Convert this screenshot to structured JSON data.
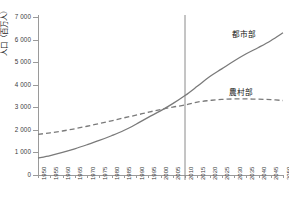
{
  "chart_data": {
    "type": "line",
    "title": "",
    "xlabel": "",
    "ylabel": "人口（百万人）",
    "ylim": [
      0,
      7000
    ],
    "xlim": [
      1950,
      2050
    ],
    "grid": false,
    "legend_position": "inline-right",
    "y_ticks": [
      "0",
      "1 000",
      "2 000",
      "3 000",
      "4 000",
      "5 000",
      "6 000",
      "7 000"
    ],
    "y_tick_values": [
      0,
      1000,
      2000,
      3000,
      4000,
      5000,
      6000,
      7000
    ],
    "categories": [
      "1950",
      "1955",
      "1960",
      "1965",
      "1970",
      "1975",
      "1980",
      "1985",
      "1990",
      "1995",
      "2000",
      "2005",
      "2010",
      "2015",
      "2020",
      "2025",
      "2030",
      "2035",
      "2040",
      "2045",
      "2050"
    ],
    "annotations": [
      {
        "name": "reference-line-2010",
        "x": 2010,
        "label": ""
      }
    ],
    "series": [
      {
        "name": "都市部",
        "style": "solid",
        "color": "#7a7a7a",
        "values": [
          750,
          860,
          1000,
          1160,
          1340,
          1530,
          1740,
          1970,
          2250,
          2550,
          2840,
          3160,
          3520,
          3930,
          4350,
          4700,
          5050,
          5370,
          5650,
          5950,
          6300
        ]
      },
      {
        "name": "農村部",
        "style": "dashed",
        "color": "#7a7a7a",
        "values": [
          1800,
          1870,
          1950,
          2050,
          2160,
          2280,
          2400,
          2530,
          2650,
          2780,
          2900,
          3010,
          3100,
          3230,
          3300,
          3350,
          3370,
          3370,
          3360,
          3340,
          3300
        ]
      }
    ]
  }
}
